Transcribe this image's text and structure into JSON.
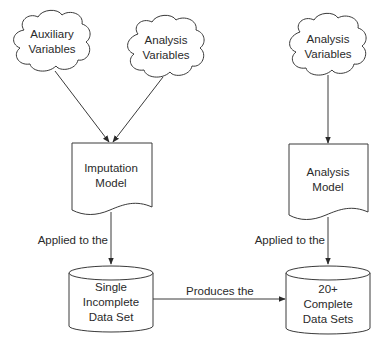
{
  "diagram": {
    "nodes": {
      "aux_vars": {
        "type": "cloud",
        "line1": "Auxiliary",
        "line2": "Variables"
      },
      "analysis_vars_left": {
        "type": "cloud",
        "line1": "Analysis",
        "line2": "Variables"
      },
      "analysis_vars_right": {
        "type": "cloud",
        "line1": "Analysis",
        "line2": "Variables"
      },
      "imputation_model": {
        "type": "document",
        "line1": "Imputation",
        "line2": "Model"
      },
      "analysis_model": {
        "type": "document",
        "line1": "Analysis",
        "line2": "Model"
      },
      "single_incomplete": {
        "type": "cylinder",
        "line1": "Single",
        "line2": "Incomplete",
        "line3": "Data Set"
      },
      "complete_sets": {
        "type": "cylinder",
        "line1": "20+",
        "line2": "Complete",
        "line3": "Data Sets"
      }
    },
    "edges": {
      "aux_to_imputation": {
        "from": "Auxiliary Variables",
        "to": "Imputation Model",
        "label": ""
      },
      "analysis_to_imputation": {
        "from": "Analysis Variables",
        "to": "Imputation Model",
        "label": ""
      },
      "imputation_to_single": {
        "from": "Imputation Model",
        "to": "Single Incomplete Data Set",
        "label": "Applied to the"
      },
      "single_to_complete": {
        "from": "Single Incomplete Data Set",
        "to": "20+ Complete Data Sets",
        "label": "Produces the"
      },
      "analysis_vars_to_model": {
        "from": "Analysis Variables",
        "to": "Analysis Model",
        "label": ""
      },
      "analysis_model_to_complete": {
        "from": "Analysis Model",
        "to": "20+ Complete Data Sets",
        "label": "Applied to the"
      }
    }
  }
}
